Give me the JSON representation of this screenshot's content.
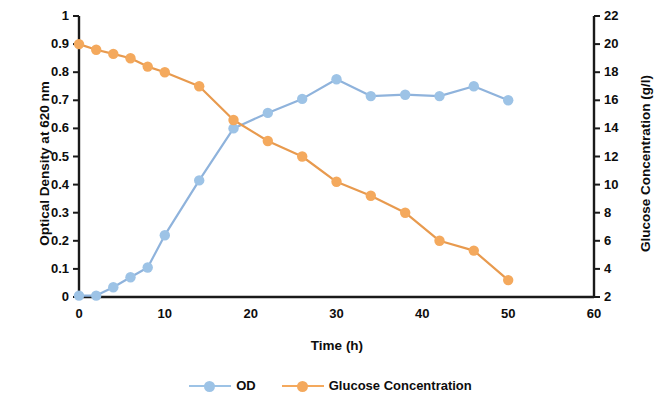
{
  "chart_data": {
    "type": "line",
    "title": "",
    "xlabel": "Time (h)",
    "x": [
      0,
      2,
      4,
      6,
      8,
      10,
      14,
      18,
      22,
      26,
      30,
      34,
      38,
      42,
      46,
      50
    ],
    "xlim": [
      0,
      60
    ],
    "xticks": [
      "0",
      "10",
      "20",
      "30",
      "40",
      "50",
      "60"
    ],
    "xtick_values": [
      0,
      10,
      20,
      30,
      40,
      50,
      60
    ],
    "grid": false,
    "legend_position": "bottom",
    "axes": [
      {
        "id": "left",
        "ylabel": "Optical Density at 620 nm",
        "ylim": [
          0,
          1
        ],
        "yticks": [
          "0",
          "0.1",
          "0.2",
          "0.3",
          "0.4",
          "0.5",
          "0.6",
          "0.7",
          "0.8",
          "0.9",
          "1"
        ],
        "ytick_values": [
          0,
          0.1,
          0.2,
          0.3,
          0.4,
          0.5,
          0.6,
          0.7,
          0.8,
          0.9,
          1
        ]
      },
      {
        "id": "right",
        "ylabel": "Glucose Concentration (g/l)",
        "ylim": [
          2,
          22
        ],
        "yticks": [
          "2",
          "4",
          "6",
          "8",
          "10",
          "12",
          "14",
          "16",
          "18",
          "20",
          "22"
        ],
        "ytick_values": [
          2,
          4,
          6,
          8,
          10,
          12,
          14,
          16,
          18,
          20,
          22
        ]
      }
    ],
    "series": [
      {
        "name": "OD",
        "axis": "left",
        "color": "#9DC3E6",
        "line_color": "#8FB3DC",
        "marker": "circle",
        "values": [
          0.005,
          0.005,
          0.035,
          0.07,
          0.105,
          0.22,
          0.415,
          0.6,
          0.655,
          0.705,
          0.775,
          0.715,
          0.72,
          0.715,
          0.75,
          0.7
        ]
      },
      {
        "name": "Glucose Concentration",
        "axis": "right",
        "color": "#F4A95D",
        "line_color": "#E89A4E",
        "marker": "circle",
        "values": [
          20.0,
          19.6,
          19.3,
          19.0,
          18.4,
          18.0,
          17.0,
          14.6,
          13.1,
          12.0,
          10.2,
          9.2,
          8.0,
          6.0,
          5.3,
          3.2
        ]
      }
    ]
  },
  "legend": {
    "items": [
      {
        "label": "OD",
        "color": "#9DC3E6"
      },
      {
        "label": "Glucose Concentration",
        "color": "#F4A95D"
      }
    ]
  },
  "colors": {
    "od": "#9DC3E6",
    "glucose": "#F4A95D",
    "axis": "#1a1a1a",
    "text": "#0d0d0d",
    "background": "#ffffff"
  }
}
